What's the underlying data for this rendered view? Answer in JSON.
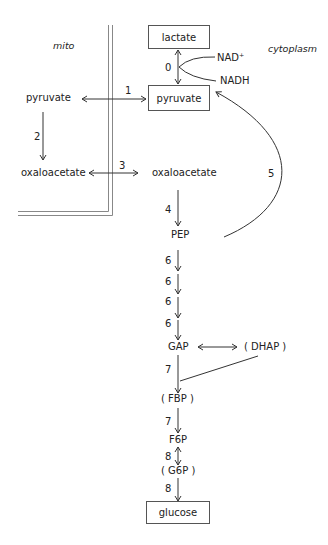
{
  "regions": {
    "mitochondria": "mito",
    "cytoplasm": "cytoplasm"
  },
  "metabolites": {
    "lactate": "lactate",
    "pyruvate_cyto": "pyruvate",
    "pyruvate_mito": "pyruvate",
    "oxaloacetate_mito": "oxaloacetate",
    "oxaloacetate_cyto": "oxaloacetate",
    "pep": "PEP",
    "gap": "GAP",
    "dhap": "( DHAP )",
    "fbp": "( FBP )",
    "f6p": "F6P",
    "g6p": "( G6P )",
    "glucose": "glucose"
  },
  "cofactors": {
    "nad_plus": "NAD⁺",
    "nadh": "NADH"
  },
  "steps": {
    "s0": "0",
    "s1": "1",
    "s2": "2",
    "s3": "3",
    "s4": "4",
    "s5": "5",
    "s6a": "6",
    "s6b": "6",
    "s6c": "6",
    "s6d": "6",
    "s7a": "7",
    "s7b": "7",
    "s8a": "8",
    "s8b": "8"
  },
  "colors": {
    "line": "#333333",
    "membrane": "#888888",
    "box_border": "#555555"
  }
}
